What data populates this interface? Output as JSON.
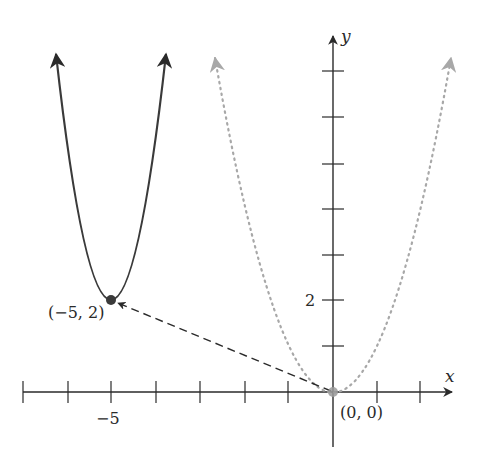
{
  "figure": {
    "axes": {
      "x_label": "x",
      "y_label": "y",
      "x_tick_label": "−5",
      "y_tick_label": "2",
      "x_range": [
        -7,
        2
      ],
      "y_range": [
        -1,
        7
      ]
    },
    "points": {
      "origin_label": "(0, 0)",
      "vertex_label": "(−5, 2)"
    },
    "curves": [
      {
        "name": "original",
        "equation": "y = x^2",
        "style": "dotted",
        "color": "#a8a8a8",
        "vertex": [
          0,
          0
        ]
      },
      {
        "name": "translated",
        "equation": "y = (x + 5)^2 + 2",
        "style": "solid",
        "color": "#3a3a3a",
        "vertex": [
          -5,
          2
        ]
      }
    ],
    "translation_arrow": {
      "from": [
        0,
        0
      ],
      "to": [
        -5,
        2
      ],
      "style": "dashed"
    },
    "colors": {
      "axis": "#2a2a2a",
      "dotted_curve": "#a8a8a8",
      "solid_curve": "#3a3a3a",
      "point": "#3a3a3a"
    }
  }
}
